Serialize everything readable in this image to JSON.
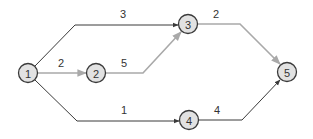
{
  "diagram": {
    "type": "directed-graph",
    "colors": {
      "dark_edge": "#3a3a3a",
      "highlight_edge": "#a9a9a9",
      "node_fill": "#e2e2e2",
      "node_stroke": "#3a3a3a"
    },
    "nodes": [
      {
        "id": "1",
        "label": "1",
        "cx": 28,
        "cy": 73
      },
      {
        "id": "2",
        "label": "2",
        "cx": 96,
        "cy": 73
      },
      {
        "id": "3",
        "label": "3",
        "cx": 188,
        "cy": 24
      },
      {
        "id": "4",
        "label": "4",
        "cx": 189,
        "cy": 120
      },
      {
        "id": "5",
        "label": "5",
        "cx": 287,
        "cy": 72
      }
    ],
    "edges": [
      {
        "from": "1",
        "to": "3",
        "weight": "3",
        "style": "dark"
      },
      {
        "from": "1",
        "to": "2",
        "weight": "2",
        "style": "highlight"
      },
      {
        "from": "2",
        "to": "3",
        "weight": "5",
        "style": "highlight"
      },
      {
        "from": "3",
        "to": "5",
        "weight": "2",
        "style": "highlight"
      },
      {
        "from": "1",
        "to": "4",
        "weight": "1",
        "style": "dark"
      },
      {
        "from": "4",
        "to": "5",
        "weight": "4",
        "style": "dark"
      }
    ]
  }
}
